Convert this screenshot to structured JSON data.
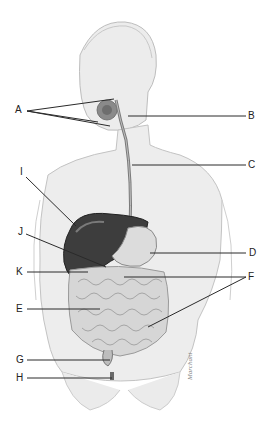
{
  "diagram": {
    "labels": [
      {
        "id": "A",
        "text": "A"
      },
      {
        "id": "B",
        "text": "B"
      },
      {
        "id": "C",
        "text": "C"
      },
      {
        "id": "D",
        "text": "D"
      },
      {
        "id": "E",
        "text": "E"
      },
      {
        "id": "F",
        "text": "F"
      },
      {
        "id": "G",
        "text": "G"
      },
      {
        "id": "H",
        "text": "H"
      },
      {
        "id": "I",
        "text": "I"
      },
      {
        "id": "J",
        "text": "J"
      },
      {
        "id": "K",
        "text": "K"
      }
    ],
    "signature": "Marchant",
    "colors": {
      "skin": "#e6e6e6",
      "skin_outline": "#b5b5b5",
      "liver": "#3a3a3a",
      "stomach": "#d9d9d9",
      "intestine": "#cfcfcf",
      "leader": "#2a2a2a"
    }
  }
}
